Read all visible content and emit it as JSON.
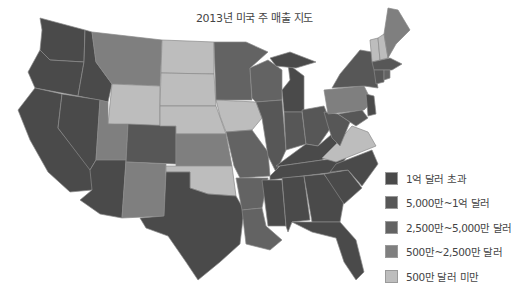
{
  "title": "2013년 미국 주 매출 지도",
  "legend": [
    {
      "label": "1억 달러 초과",
      "color": "#4a4a4a"
    },
    {
      "label": "5,000만~1억 달러",
      "color": "#575757"
    },
    {
      "label": "2,500만~5,000만 달러",
      "color": "#636363"
    },
    {
      "label": "500만~2,500만 달러",
      "color": "#7f7f7f"
    },
    {
      "label": "500만 달러 미만",
      "color": "#bdbdbd"
    }
  ],
  "states": [
    {
      "name": "WA",
      "tier": 0,
      "points": "40,18 85,30 84,62 50,60 40,50 42,30"
    },
    {
      "name": "OR",
      "tier": 0,
      "points": "40,50 50,60 84,62 78,96 35,88 28,72"
    },
    {
      "name": "CA",
      "tier": 0,
      "points": "35,88 62,94 58,128 96,176 92,190 70,192 48,172 30,140 18,110"
    },
    {
      "name": "ID",
      "tier": 0,
      "points": "85,30 92,32 96,62 112,84 108,102 78,96 84,62"
    },
    {
      "name": "NV",
      "tier": 0,
      "points": "62,94 100,100 96,160 90,170 58,128"
    },
    {
      "name": "MT",
      "tier": 3,
      "points": "92,32 162,40 160,86 112,84 96,62"
    },
    {
      "name": "WY",
      "tier": 4,
      "points": "112,84 160,86 160,128 108,124"
    },
    {
      "name": "UT",
      "tier": 3,
      "points": "100,100 108,102 108,124 128,124 126,160 96,160"
    },
    {
      "name": "AZ",
      "tier": 0,
      "points": "96,160 126,160 122,218 100,214 80,200 92,190 90,170"
    },
    {
      "name": "CO",
      "tier": 1,
      "points": "128,124 176,126 176,164 126,162"
    },
    {
      "name": "NM",
      "tier": 3,
      "points": "126,162 166,164 164,216 122,218"
    },
    {
      "name": "ND",
      "tier": 4,
      "points": "162,40 214,42 214,74 161,73"
    },
    {
      "name": "SD",
      "tier": 4,
      "points": "161,73 214,74 216,106 160,106"
    },
    {
      "name": "NE",
      "tier": 4,
      "points": "160,106 216,106 226,134 176,134 176,126 160,126"
    },
    {
      "name": "KS",
      "tier": 3,
      "points": "176,134 226,134 232,166 176,166"
    },
    {
      "name": "OK",
      "tier": 4,
      "points": "166,166 232,166 236,196 208,194 190,188 190,172 166,172"
    },
    {
      "name": "TX",
      "tier": 0,
      "points": "166,172 190,172 190,188 208,194 236,196 244,210 240,244 220,262 198,280 186,262 168,236 146,228 140,218 164,216"
    },
    {
      "name": "MN",
      "tier": 2,
      "points": "214,42 246,42 268,52 250,68 252,100 216,100"
    },
    {
      "name": "IA",
      "tier": 4,
      "points": "216,100 256,102 262,118 252,130 226,132 220,116"
    },
    {
      "name": "MO",
      "tier": 2,
      "points": "226,132 252,130 268,152 270,176 240,178 234,166"
    },
    {
      "name": "AR",
      "tier": 2,
      "points": "236,178 268,178 262,208 242,210"
    },
    {
      "name": "LA",
      "tier": 2,
      "points": "242,210 262,208 266,226 282,240 270,250 246,244"
    },
    {
      "name": "WI",
      "tier": 2,
      "points": "250,68 268,60 282,70 282,100 256,102 252,98"
    },
    {
      "name": "IL",
      "tier": 1,
      "points": "256,102 282,100 286,150 276,172 268,156 262,118"
    },
    {
      "name": "MI",
      "tier": 0,
      "points": "288,64 304,76 304,112 284,112 282,90 290,80"
    },
    {
      "name": "MI-UP",
      "tier": 0,
      "points": "270,58 290,52 316,62 296,68 276,66"
    },
    {
      "name": "IN",
      "tier": 1,
      "points": "284,112 302,112 306,144 286,150"
    },
    {
      "name": "OH",
      "tier": 1,
      "points": "302,110 324,106 332,126 318,146 306,144"
    },
    {
      "name": "KY",
      "tier": 0,
      "points": "276,166 306,144 318,146 332,134 340,148 322,160 280,166"
    },
    {
      "name": "TN",
      "tier": 0,
      "points": "270,176 280,166 322,160 346,158 336,172 270,180"
    },
    {
      "name": "MS",
      "tier": 0,
      "points": "262,180 282,180 286,226 268,226"
    },
    {
      "name": "AL",
      "tier": 0,
      "points": "282,178 304,176 310,220 292,222 288,232 286,226"
    },
    {
      "name": "GA",
      "tier": 0,
      "points": "304,176 324,174 344,200 340,222 312,222"
    },
    {
      "name": "FL",
      "tier": 0,
      "points": "292,222 340,222 356,240 364,272 356,280 344,262 336,238 312,232"
    },
    {
      "name": "SC",
      "tier": 0,
      "points": "324,174 348,170 362,188 344,204"
    },
    {
      "name": "NC",
      "tier": 0,
      "points": "336,164 372,150 378,164 362,186 348,170 330,172"
    },
    {
      "name": "VA",
      "tier": 4,
      "points": "322,158 338,142 352,126 368,132 376,146 336,162"
    },
    {
      "name": "WV",
      "tier": 1,
      "points": "324,112 338,114 350,122 340,146 332,138 328,126"
    },
    {
      "name": "PA",
      "tier": 3,
      "points": "324,90 364,86 372,102 364,110 328,114"
    },
    {
      "name": "NY",
      "tier": 1,
      "points": "340,74 360,50 372,52 378,88 364,86 332,88"
    },
    {
      "name": "NJ",
      "tier": 0,
      "points": "366,94 374,96 376,114 368,116"
    },
    {
      "name": "MD",
      "tier": 1,
      "points": "338,114 362,110 368,118 356,126"
    },
    {
      "name": "VT",
      "tier": 4,
      "points": "370,40 378,38 380,60 372,62"
    },
    {
      "name": "NH",
      "tier": 4,
      "points": "378,38 384,34 388,58 380,60"
    },
    {
      "name": "ME",
      "tier": 3,
      "points": "384,34 388,8 398,10 410,30 396,44 388,58"
    },
    {
      "name": "MA",
      "tier": 1,
      "points": "372,62 390,58 402,64 392,70 374,70"
    },
    {
      "name": "CT",
      "tier": 1,
      "points": "374,70 384,70 384,82 376,84"
    },
    {
      "name": "RI",
      "tier": 2,
      "points": "384,70 390,70 390,78 384,80"
    }
  ]
}
